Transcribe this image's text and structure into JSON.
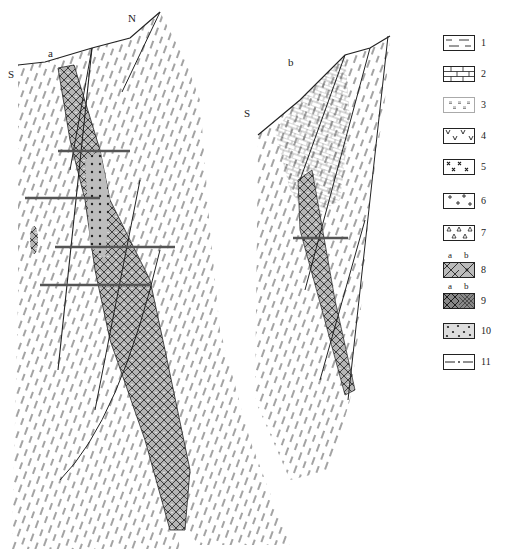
{
  "figure": {
    "section_a": {
      "label": "a",
      "left_direction": "S",
      "right_direction": "N"
    },
    "section_b": {
      "label": "b",
      "left_direction": "S",
      "right_direction": "N"
    }
  },
  "legend": {
    "items": [
      {
        "number": "1",
        "pattern": "dashed-shale"
      },
      {
        "number": "2",
        "pattern": "brick-limestone"
      },
      {
        "number": "3",
        "pattern": "double-dash-sandstone"
      },
      {
        "number": "4",
        "pattern": "v-volcanic"
      },
      {
        "number": "5",
        "pattern": "x-cross"
      },
      {
        "number": "6",
        "pattern": "plus-granite"
      },
      {
        "number": "7",
        "pattern": "triangle-breccia"
      },
      {
        "number": "8",
        "pattern": "crosshatch-ore",
        "sub_labels": [
          "a",
          "b"
        ]
      },
      {
        "number": "9",
        "pattern": "dense-crosshatch-ore",
        "sub_labels": [
          "a",
          "b"
        ]
      },
      {
        "number": "10",
        "pattern": "dotted"
      },
      {
        "number": "11",
        "pattern": "dash-dot-line"
      }
    ]
  },
  "colors": {
    "ink": "#222222",
    "ore_fill": "#9a9a9a",
    "ore_light": "#c8c8c8",
    "background": "#ffffff"
  }
}
